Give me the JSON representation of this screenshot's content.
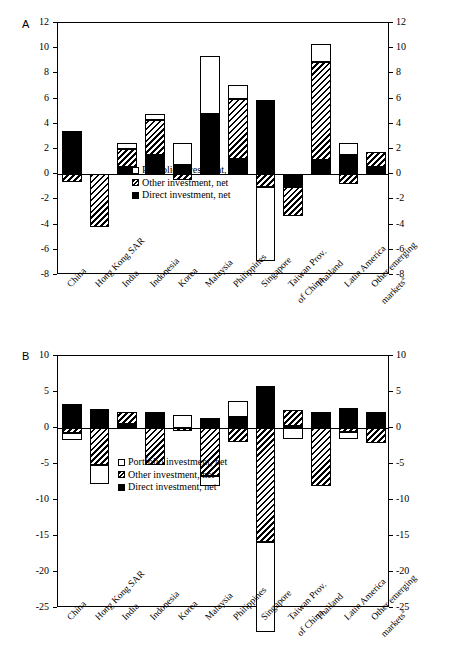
{
  "figure": {
    "panel_a_letter": "A",
    "panel_b_letter": "B"
  },
  "legend": {
    "portfolio": "Portfolio investment, net",
    "other": "Other investment, net",
    "direct": "Direct investment, net"
  },
  "categories": [
    "China",
    "Hong Kong SAR",
    "India",
    "Indonesia",
    "Korea",
    "Malaysia",
    "Philippines",
    "Singapore",
    "Taiwan Prov. of China",
    "Thailand",
    "Latin America",
    "Other emerging markets"
  ],
  "category_lines": [
    [
      "China"
    ],
    [
      "Hong Kong SAR"
    ],
    [
      "India"
    ],
    [
      "Indonesia"
    ],
    [
      "Korea"
    ],
    [
      "Malaysia"
    ],
    [
      "Philippines"
    ],
    [
      "Singapore"
    ],
    [
      "Taiwan Prov.",
      "of China"
    ],
    [
      "Thailand"
    ],
    [
      "Latin America"
    ],
    [
      "Other emerging",
      "markets"
    ]
  ],
  "footnote_marker": "a",
  "chart_data": [
    {
      "panel": "A",
      "type": "bar",
      "stacked": true,
      "title": "",
      "xlabel": "",
      "ylabel": "",
      "ylim": [
        -8,
        12
      ],
      "yticks": [
        -8,
        -6,
        -4,
        -2,
        0,
        2,
        4,
        6,
        8,
        10,
        12
      ],
      "ytick_labels": [
        "-8",
        "-6",
        "-4",
        "-2",
        "0",
        "2",
        "4",
        "6",
        "8",
        "10",
        "12"
      ],
      "grid": false,
      "legend_position": "inside-center-lower",
      "dual_axis": true,
      "categories": [
        "China",
        "Hong Kong SAR",
        "India",
        "Indonesia",
        "Korea",
        "Malaysia",
        "Philippines",
        "Singapore",
        "Taiwan Prov. of China",
        "Thailand",
        "Latin America",
        "Other emerging markets"
      ],
      "series": [
        {
          "name": "Direct investment, net",
          "values": [
            3.3,
            0.0,
            0.6,
            1.5,
            0.7,
            4.8,
            1.2,
            5.9,
            -1.0,
            1.1,
            1.5,
            0.6
          ]
        },
        {
          "name": "Other investment, net",
          "values": [
            -0.6,
            -4.2,
            1.4,
            2.8,
            -0.5,
            0.0,
            4.8,
            -1.0,
            -2.3,
            7.8,
            -0.8,
            1.2
          ]
        },
        {
          "name": "Portfolio investment, net",
          "values": [
            0.1,
            0.0,
            0.5,
            0.5,
            1.8,
            4.6,
            1.1,
            -5.9,
            0.0,
            1.4,
            1.0,
            0.0
          ]
        }
      ]
    },
    {
      "panel": "B",
      "type": "bar",
      "stacked": true,
      "title": "",
      "xlabel": "",
      "ylabel": "",
      "ylim": [
        -25,
        10
      ],
      "yticks": [
        -25,
        -20,
        -15,
        -10,
        -5,
        0,
        5,
        10
      ],
      "ytick_labels": [
        "-25",
        "-20",
        "-15",
        "-10",
        "-5",
        "0",
        "5",
        "10"
      ],
      "grid": false,
      "legend_position": "inside-center-lower",
      "dual_axis": true,
      "categories": [
        "China",
        "Hong Kong SAR",
        "India",
        "Indonesia",
        "Korea",
        "Malaysia",
        "Philippines",
        "Singapore",
        "Taiwan Prov. of China",
        "Thailand",
        "Latin America",
        "Other emerging markets"
      ],
      "series": [
        {
          "name": "Direct investment, net",
          "values": [
            3.4,
            2.6,
            0.6,
            2.2,
            0.0,
            1.4,
            1.5,
            5.9,
            0.3,
            2.2,
            2.8,
            2.2
          ]
        },
        {
          "name": "Other investment, net",
          "values": [
            -0.7,
            -5.1,
            1.6,
            -5.2,
            -0.4,
            -6.7,
            -2.0,
            -15.9,
            2.2,
            -8.1,
            -0.5,
            -2.1
          ]
        },
        {
          "name": "Portfolio investment, net",
          "values": [
            -0.9,
            -2.7,
            0.0,
            0.0,
            1.8,
            -1.3,
            2.3,
            -12.5,
            -1.5,
            0.0,
            -1.0,
            0.0
          ]
        }
      ]
    }
  ]
}
